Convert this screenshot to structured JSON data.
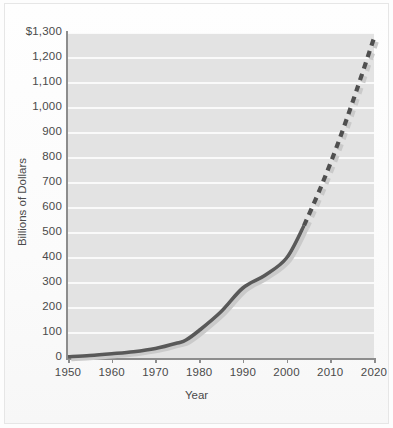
{
  "chart_data": {
    "type": "line",
    "title": "",
    "xlabel": "Year",
    "ylabel": "Billions of Dollars",
    "xlim": [
      1950,
      2020
    ],
    "ylim": [
      0,
      1300
    ],
    "grid": "horizontal",
    "legend": "none",
    "x_ticks": [
      "1950",
      "1960",
      "1970",
      "1980",
      "1990",
      "2000",
      "2010",
      "2020"
    ],
    "x_tick_values": [
      1950,
      1960,
      1970,
      1980,
      1990,
      2000,
      2010,
      2020
    ],
    "y_ticks": [
      "0",
      "100",
      "200",
      "300",
      "400",
      "500",
      "600",
      "700",
      "800",
      "900",
      "1,000",
      "1,100",
      "1,200",
      "$1,300"
    ],
    "y_tick_values": [
      0,
      100,
      200,
      300,
      400,
      500,
      600,
      700,
      800,
      900,
      1000,
      1100,
      1200,
      1300
    ],
    "series": [
      {
        "name": "actual",
        "style": "solid",
        "color": "#595959",
        "x": [
          1950,
          1955,
          1960,
          1965,
          1970,
          1975,
          1977,
          1980,
          1985,
          1990,
          1995,
          2000,
          2004
        ],
        "values": [
          5,
          10,
          17,
          25,
          38,
          60,
          72,
          110,
          185,
          280,
          330,
          400,
          530
        ]
      },
      {
        "name": "projected",
        "style": "dashed",
        "color": "#4f4f4f",
        "x": [
          2004,
          2008,
          2012,
          2016,
          2020
        ],
        "values": [
          530,
          690,
          870,
          1070,
          1280
        ]
      }
    ],
    "colors": {
      "plot_background": "#e3e3e3",
      "gridline": "#fafafa",
      "axis": "#8d8d8d",
      "line_solid": "#595959",
      "line_dashed": "#4f4f4f",
      "shadow": "#cacaca",
      "tick_text": "#4a4a4a",
      "page_background": "#fdfdfd"
    }
  }
}
